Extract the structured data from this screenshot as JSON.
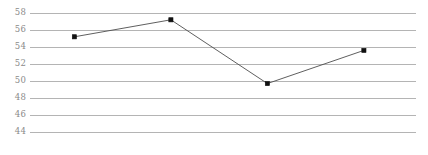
{
  "chart_data": {
    "type": "line",
    "title": "",
    "subtitle": "",
    "xlabel": "",
    "ylabel": "",
    "x": [
      1,
      2,
      3,
      4
    ],
    "values": [
      55.2,
      57.2,
      49.7,
      53.6
    ],
    "series": [
      {
        "name": "",
        "values": [
          55.2,
          57.2,
          49.7,
          53.6
        ]
      }
    ],
    "categories": [
      "",
      "",
      "",
      ""
    ],
    "ylim": [
      43.0,
      58.9
    ],
    "xlim": [
      0.5,
      4.5
    ],
    "y_ticks": [
      44,
      46,
      48,
      50,
      52,
      54,
      56,
      58
    ],
    "y_tick_labels": [
      "44",
      "46",
      "48",
      "50",
      "52",
      "54",
      "56",
      "58"
    ],
    "x_ticks": [],
    "x_tick_labels": [],
    "grid": {
      "horizontal": true,
      "vertical": false,
      "color": "#b4b4b4"
    },
    "legend": {
      "visible": false,
      "position": "none",
      "entries": []
    },
    "line_color": "#4d4d4d",
    "marker_color": "#111111",
    "marker_shape": "square",
    "background_color": "#ffffff",
    "tick_label_color": "#8a8a8a",
    "annotations": []
  }
}
